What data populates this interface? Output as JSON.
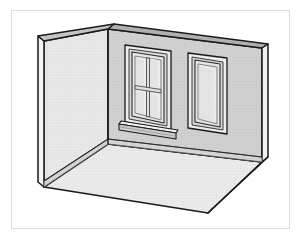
{
  "illustration": {
    "title": "Interior room corner with two windows",
    "subject": "architectural-line-drawing",
    "view": "two-point-interior-perspective",
    "canvas": {
      "width": 301,
      "height": 239,
      "background": "#ffffff"
    },
    "border": {
      "visible": true,
      "color": "#dcdcdc",
      "inset_left": 11,
      "inset_top": 10,
      "width": 279,
      "height": 219
    },
    "palette": {
      "outline": "#1a1a1a",
      "left_wall": "#e8e8e8",
      "back_wall": "#cfcfcf",
      "wall_top_edge": "#b4b4b4",
      "wall_cut_edge": "#f2f2f2",
      "floor": "#e9e9e9",
      "baseboard": "#d6d6d6",
      "window_casing": "#eaeaea",
      "window_casing_shadow": "#a9a9a9",
      "window_sash": "#dedede",
      "glass": "#e4e4e4",
      "sill_top": "#f0f0f0",
      "sill_face": "#cacaca",
      "paper": "#ffffff"
    },
    "parts": [
      {
        "name": "left-wall",
        "label": "Left wall",
        "fill": "#e8e8e8"
      },
      {
        "name": "back-wall",
        "label": "Back wall",
        "fill": "#cfcfcf"
      },
      {
        "name": "floor",
        "label": "Floor",
        "fill": "#e9e9e9"
      },
      {
        "name": "ceiling-top-edge",
        "label": "Wall top thickness",
        "fill": "#b4b4b4"
      },
      {
        "name": "left-wall-cut-edge",
        "label": "Left wall cut edge",
        "fill": "#f2f2f2"
      },
      {
        "name": "right-wall-cut-edge",
        "label": "Right wall cut edge",
        "fill": "#f2f2f2"
      },
      {
        "name": "baseboard",
        "label": "Baseboard",
        "fill": "#d6d6d6"
      }
    ],
    "windows": [
      {
        "name": "left-window",
        "label": "Mullioned window",
        "panes": 4,
        "grid": "2x2",
        "has_sill": true,
        "has_casing": true,
        "glass_fill": "#e4e4e4"
      },
      {
        "name": "right-window",
        "label": "Plain framed window",
        "panes": 1,
        "grid": "1x1",
        "has_sill": false,
        "has_casing": true,
        "glass_fill": "#e4e4e4"
      }
    ],
    "counts": {
      "walls": 2,
      "windows": 2,
      "left_window_panes": 4,
      "right_window_panes": 1
    }
  }
}
